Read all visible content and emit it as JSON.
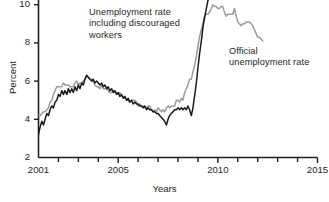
{
  "chart_data": {
    "type": "line",
    "title": "",
    "xlabel": "Years",
    "ylabel": "Percent",
    "xlim": [
      2001,
      2015
    ],
    "ylim": [
      2,
      11.2
    ],
    "grid": false,
    "legend_position": "annotations-on-plot",
    "y_ticks": [
      "2",
      "4",
      "6",
      "8",
      "10"
    ],
    "y_tick_values": [
      2,
      4,
      6,
      8,
      10
    ],
    "x_ticks": [
      "2001",
      "2005",
      "2010",
      "2015"
    ],
    "x_tick_values": [
      2001,
      2005,
      2010,
      2015
    ],
    "x_minor_tick_values": [
      2002,
      2003,
      2004,
      2006,
      2007,
      2008,
      2009,
      2011,
      2012,
      2013,
      2014
    ],
    "annotations": [
      {
        "name": "u6-label",
        "text": "Unemployment rate\nincluding discouraged\nworkers",
        "lines": [
          "Unemployment rate",
          "including discouraged",
          "workers"
        ]
      },
      {
        "name": "u3-label",
        "text": "Official\nunemployment rate",
        "lines": [
          "Official",
          "unemployment rate"
        ]
      }
    ],
    "series": [
      {
        "name": "Unemployment rate including discouraged workers",
        "short_name": "U-6",
        "color": "#1a1a1a",
        "width": 1.5,
        "x": [
          2001.0,
          2001.08,
          2001.17,
          2001.25,
          2001.33,
          2001.42,
          2001.5,
          2001.58,
          2001.67,
          2001.75,
          2001.83,
          2001.92,
          2002.0,
          2002.08,
          2002.17,
          2002.25,
          2002.33,
          2002.42,
          2002.5,
          2002.58,
          2002.67,
          2002.75,
          2002.83,
          2002.92,
          2003.0,
          2003.08,
          2003.17,
          2003.25,
          2003.33,
          2003.42,
          2003.5,
          2003.58,
          2003.67,
          2003.75,
          2003.83,
          2003.92,
          2004.0,
          2004.08,
          2004.17,
          2004.25,
          2004.33,
          2004.42,
          2004.5,
          2004.58,
          2004.67,
          2004.75,
          2004.83,
          2004.92,
          2005.0,
          2005.08,
          2005.17,
          2005.25,
          2005.33,
          2005.42,
          2005.5,
          2005.58,
          2005.67,
          2005.75,
          2005.83,
          2005.92,
          2006.0,
          2006.08,
          2006.17,
          2006.25,
          2006.33,
          2006.42,
          2006.5,
          2006.58,
          2006.67,
          2006.75,
          2006.83,
          2006.92,
          2007.0,
          2007.08,
          2007.17,
          2007.25,
          2007.33,
          2007.42,
          2007.5,
          2007.58,
          2007.67,
          2007.75,
          2007.83,
          2007.92,
          2008.0,
          2008.08,
          2008.17,
          2008.25,
          2008.33,
          2008.42,
          2008.5,
          2008.58,
          2008.67,
          2008.75,
          2008.83,
          2008.92,
          2009.0,
          2009.08,
          2009.17,
          2009.25,
          2009.33,
          2009.42,
          2009.5,
          2009.58,
          2009.67,
          2009.75,
          2009.83,
          2009.92,
          2010.0,
          2010.08,
          2010.17,
          2010.25,
          2010.33,
          2010.42,
          2010.5,
          2010.58,
          2010.67,
          2010.75,
          2010.83,
          2010.92,
          2011.0,
          2011.08,
          2011.17,
          2011.25,
          2011.33,
          2011.42,
          2011.5,
          2011.58,
          2011.67,
          2011.75,
          2011.83,
          2011.92,
          2012.0,
          2012.08,
          2012.17,
          2012.25
        ],
        "y": [
          3.2,
          3.6,
          3.9,
          3.7,
          4.0,
          4.3,
          4.2,
          4.5,
          4.7,
          4.6,
          4.9,
          5.0,
          5.3,
          5.2,
          5.5,
          5.3,
          5.5,
          5.3,
          5.6,
          5.4,
          5.6,
          5.4,
          5.7,
          5.5,
          5.8,
          5.6,
          5.9,
          5.8,
          6.1,
          6.3,
          6.2,
          6.1,
          6.0,
          6.1,
          5.9,
          6.0,
          5.9,
          5.8,
          5.9,
          5.7,
          5.8,
          5.6,
          5.7,
          5.5,
          5.6,
          5.4,
          5.5,
          5.3,
          5.4,
          5.2,
          5.3,
          5.1,
          5.2,
          5.0,
          5.1,
          4.9,
          5.0,
          4.8,
          4.9,
          4.8,
          4.8,
          4.7,
          4.7,
          4.6,
          4.7,
          4.5,
          4.6,
          4.5,
          4.5,
          4.4,
          4.4,
          4.3,
          4.3,
          4.2,
          4.1,
          4.0,
          3.9,
          3.7,
          4.0,
          4.2,
          4.3,
          4.4,
          4.5,
          4.5,
          4.6,
          4.5,
          4.6,
          4.5,
          4.6,
          4.5,
          4.7,
          4.5,
          4.2,
          4.6,
          5.2,
          5.9,
          6.7,
          7.4,
          8.1,
          8.8,
          9.3,
          9.8,
          10.2,
          10.5,
          10.9,
          11.2,
          11.4,
          11.5,
          11.5,
          11.3,
          11.5,
          11.3,
          11.1,
          11.3,
          11.2,
          11.4,
          11.2,
          11.3,
          11.1,
          11.2,
          11.2,
          11.0,
          11.2,
          11.1,
          10.9,
          11.1,
          11.3,
          11.1,
          11.2,
          11.0,
          10.8,
          10.7,
          10.6,
          10.5,
          10.4,
          10.3
        ]
      },
      {
        "name": "Official unemployment rate",
        "short_name": "U-3",
        "color": "#9b9b9b",
        "width": 1.5,
        "x": [
          2001.0,
          2001.08,
          2001.17,
          2001.25,
          2001.33,
          2001.42,
          2001.5,
          2001.58,
          2001.67,
          2001.75,
          2001.83,
          2001.92,
          2002.0,
          2002.08,
          2002.17,
          2002.25,
          2002.33,
          2002.42,
          2002.5,
          2002.58,
          2002.67,
          2002.75,
          2002.83,
          2002.92,
          2003.0,
          2003.08,
          2003.17,
          2003.25,
          2003.33,
          2003.42,
          2003.5,
          2003.58,
          2003.67,
          2003.75,
          2003.83,
          2003.92,
          2004.0,
          2004.08,
          2004.17,
          2004.25,
          2004.33,
          2004.42,
          2004.5,
          2004.58,
          2004.67,
          2004.75,
          2004.83,
          2004.92,
          2005.0,
          2005.08,
          2005.17,
          2005.25,
          2005.33,
          2005.42,
          2005.5,
          2005.58,
          2005.67,
          2005.75,
          2005.83,
          2005.92,
          2006.0,
          2006.08,
          2006.17,
          2006.25,
          2006.33,
          2006.42,
          2006.5,
          2006.58,
          2006.67,
          2006.75,
          2006.83,
          2006.92,
          2007.0,
          2007.08,
          2007.17,
          2007.25,
          2007.33,
          2007.42,
          2007.5,
          2007.58,
          2007.67,
          2007.75,
          2007.83,
          2007.92,
          2008.0,
          2008.08,
          2008.17,
          2008.25,
          2008.33,
          2008.42,
          2008.5,
          2008.58,
          2008.67,
          2008.75,
          2008.83,
          2008.92,
          2009.0,
          2009.08,
          2009.17,
          2009.25,
          2009.33,
          2009.42,
          2009.5,
          2009.58,
          2009.67,
          2009.75,
          2009.83,
          2009.92,
          2010.0,
          2010.08,
          2010.17,
          2010.25,
          2010.33,
          2010.42,
          2010.5,
          2010.58,
          2010.67,
          2010.75,
          2010.83,
          2010.92,
          2011.0,
          2011.08,
          2011.17,
          2011.25,
          2011.33,
          2011.42,
          2011.5,
          2011.58,
          2011.67,
          2011.75,
          2011.83,
          2011.92,
          2012.0,
          2012.08,
          2012.17,
          2012.25
        ],
        "y": [
          4.2,
          4.2,
          4.3,
          4.4,
          4.4,
          4.5,
          4.6,
          4.9,
          5.0,
          5.3,
          5.5,
          5.7,
          5.7,
          5.7,
          5.7,
          5.9,
          5.8,
          5.8,
          5.8,
          5.7,
          5.7,
          5.7,
          5.9,
          6.0,
          5.8,
          5.9,
          5.9,
          6.0,
          6.1,
          6.3,
          6.2,
          6.1,
          6.1,
          6.0,
          5.8,
          5.7,
          5.7,
          5.6,
          5.8,
          5.6,
          5.6,
          5.6,
          5.5,
          5.4,
          5.4,
          5.5,
          5.4,
          5.4,
          5.3,
          5.4,
          5.2,
          5.2,
          5.1,
          5.0,
          5.0,
          4.9,
          5.0,
          5.0,
          5.0,
          4.9,
          4.7,
          4.8,
          4.7,
          4.7,
          4.6,
          4.6,
          4.7,
          4.7,
          4.5,
          4.4,
          4.5,
          4.4,
          4.6,
          4.5,
          4.4,
          4.5,
          4.4,
          4.6,
          4.7,
          4.6,
          4.7,
          4.7,
          4.7,
          5.0,
          5.0,
          4.9,
          5.1,
          5.0,
          5.4,
          5.6,
          5.8,
          6.1,
          6.1,
          6.5,
          6.8,
          7.3,
          7.8,
          8.3,
          8.7,
          9.0,
          9.4,
          9.5,
          9.5,
          9.6,
          9.8,
          10.0,
          9.9,
          9.9,
          9.8,
          9.8,
          9.9,
          9.9,
          9.6,
          9.4,
          9.5,
          9.5,
          9.5,
          9.5,
          9.8,
          9.4,
          9.1,
          9.0,
          8.9,
          9.0,
          9.0,
          9.1,
          9.1,
          9.1,
          9.0,
          8.9,
          8.7,
          8.5,
          8.3,
          8.3,
          8.2,
          8.1
        ]
      }
    ]
  },
  "axes": {
    "y_label": "Percent",
    "x_label": "Years"
  }
}
